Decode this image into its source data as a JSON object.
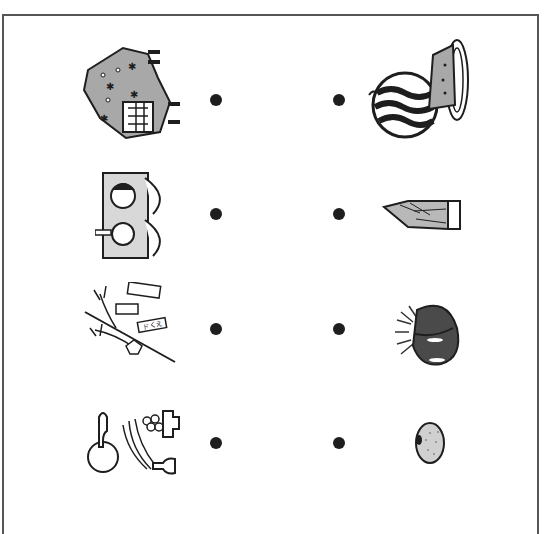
{
  "worksheet": {
    "type": "matching-exercise",
    "instructions_visible": false,
    "colors": {
      "line": "#1e1e1e",
      "frame": "#555555",
      "fill_gray": "#a8a8a8",
      "background": "#ffffff"
    },
    "left_items": [
      {
        "id": "setsubun",
        "icon": "oni-mask-mamemaki-icon",
        "desc": "Setsubun oni demon and bean-throwing figures"
      },
      {
        "id": "hinamatsuri",
        "icon": "hina-dolls-icon",
        "desc": "Hina matsuri dolls with folding screen"
      },
      {
        "id": "tanabata",
        "icon": "tanabata-bamboo-icon",
        "desc": "Tanabata bamboo branch with tanzaku wishes",
        "tag_text": "ドくえ"
      },
      {
        "id": "tsukimi",
        "icon": "tsukimi-dango-icon",
        "desc": "Moon viewing with dango stand and susuki grass"
      }
    ],
    "right_items": [
      {
        "id": "watermelon",
        "icon": "watermelon-icon",
        "desc": "Watermelon with slice on plate"
      },
      {
        "id": "bamboo-shoot",
        "icon": "bamboo-shoot-icon",
        "desc": "Takenoko bamboo shoot"
      },
      {
        "id": "chestnut",
        "icon": "chestnut-icon",
        "desc": "Chestnut with spiky burr"
      },
      {
        "id": "egg",
        "icon": "egg-icon",
        "desc": "Speckled egg / bean"
      }
    ],
    "dots": {
      "left_x": 216,
      "right_x": 339,
      "rows_y": [
        100,
        214,
        329,
        443
      ]
    }
  }
}
